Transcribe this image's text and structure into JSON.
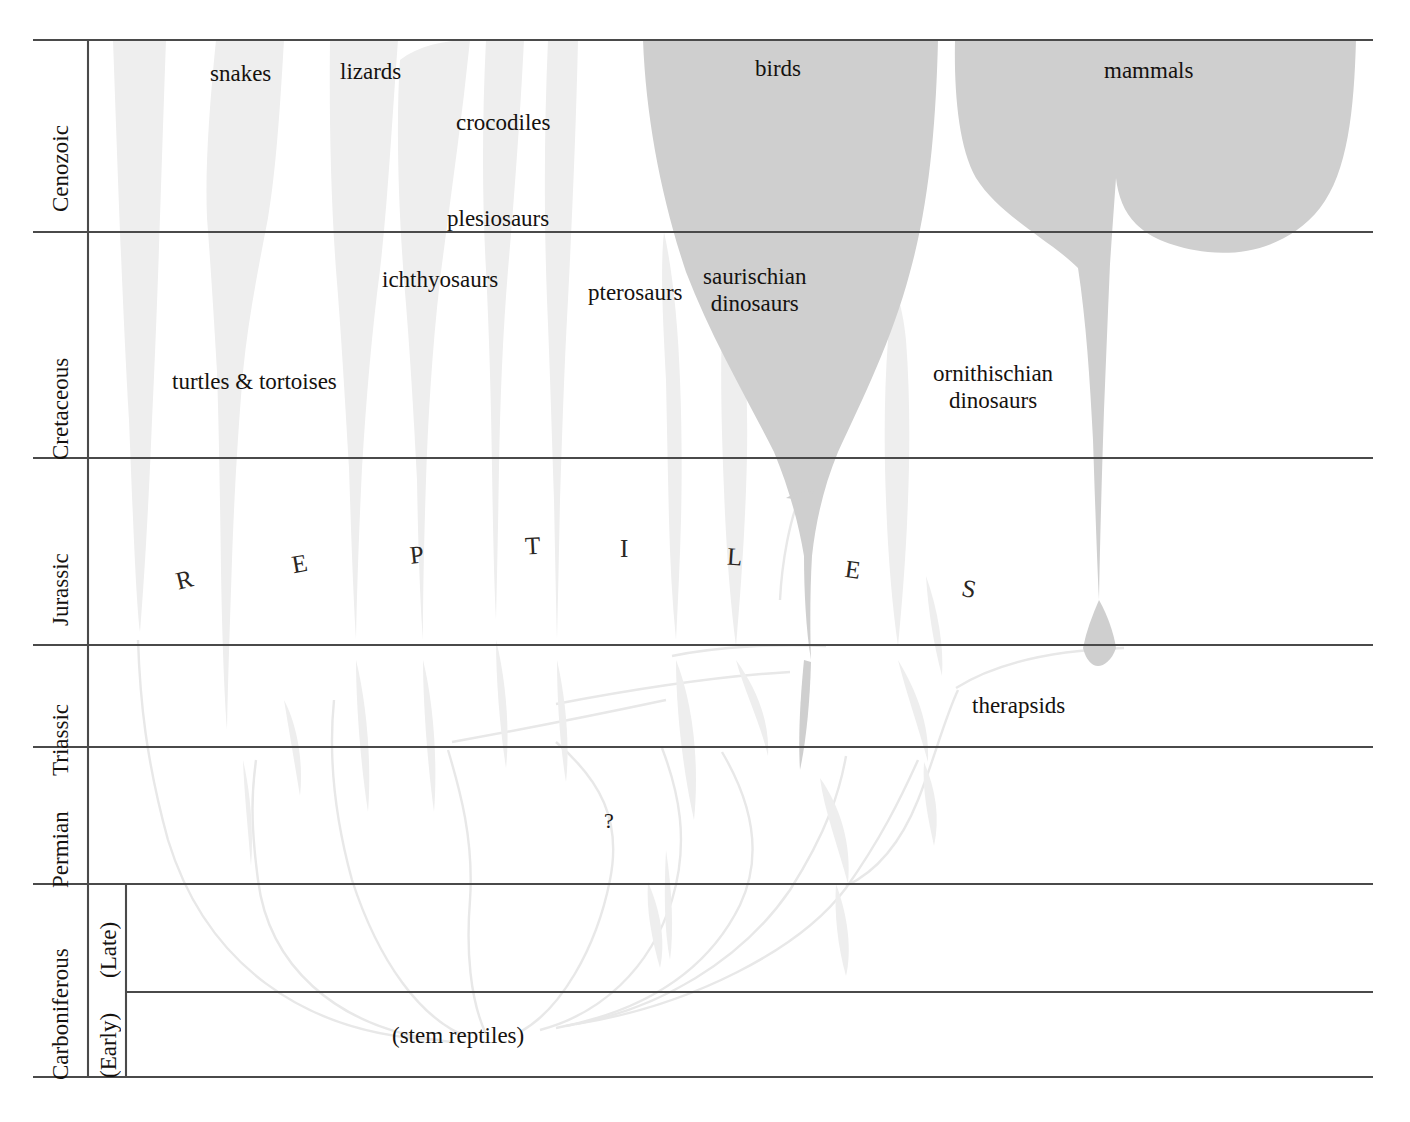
{
  "figure": {
    "kind": "phylogenetic-spindle-diagram",
    "background": "#ffffff",
    "line_color": "#4a4a4a",
    "pale_fill": "#eeeeee",
    "dark_fill": "#cfcfcf",
    "branch_color": "#e6e6e6"
  },
  "eras": [
    {
      "id": "cenozoic",
      "label": "Cenozoic",
      "y_top": 40,
      "y_bottom": 232
    },
    {
      "id": "cretaceous",
      "label": "Cretaceous",
      "y_top": 232,
      "y_bottom": 458
    },
    {
      "id": "jurassic",
      "label": "Jurassic",
      "y_top": 458,
      "y_bottom": 645
    },
    {
      "id": "triassic",
      "label": "Triassic",
      "y_top": 645,
      "y_bottom": 747
    },
    {
      "id": "permian",
      "label": "Permian",
      "y_top": 747,
      "y_bottom": 884
    },
    {
      "id": "carb-late",
      "label": "(Late)",
      "y_top": 884,
      "y_bottom": 992
    },
    {
      "id": "carb-early",
      "label": "(Early)",
      "y_top": 992,
      "y_bottom": 1077
    }
  ],
  "era_group": {
    "label": "Carboniferous",
    "spans": [
      "carb-late",
      "carb-early"
    ]
  },
  "boundary_lines_y": [
    40,
    232,
    458,
    645,
    747,
    884,
    992,
    1077
  ],
  "groups": [
    {
      "id": "turtles",
      "label": "turtles & tortoises",
      "x": 172,
      "y": 368,
      "shade": "pale"
    },
    {
      "id": "snakes",
      "label": "snakes",
      "x": 210,
      "y": 60,
      "shade": "pale"
    },
    {
      "id": "lizards",
      "label": "lizards",
      "x": 340,
      "y": 58,
      "shade": "pale"
    },
    {
      "id": "crocodiles",
      "label": "crocodiles",
      "x": 456,
      "y": 109,
      "shade": "pale"
    },
    {
      "id": "plesiosaurs",
      "label": "plesiosaurs",
      "x": 447,
      "y": 205,
      "shade": "pale"
    },
    {
      "id": "ichthyosaurs",
      "label": "ichthyosaurs",
      "x": 382,
      "y": 266,
      "shade": "pale"
    },
    {
      "id": "pterosaurs",
      "label": "pterosaurs",
      "x": 588,
      "y": 279,
      "shade": "pale"
    },
    {
      "id": "saurischian",
      "label": "saurischian\ndinosaurs",
      "x": 703,
      "y": 263,
      "shade": "pale"
    },
    {
      "id": "ornithischian",
      "label": "ornithischian\ndinosaurs",
      "x": 933,
      "y": 360,
      "shade": "pale"
    },
    {
      "id": "birds",
      "label": "birds",
      "x": 755,
      "y": 55,
      "shade": "dark"
    },
    {
      "id": "mammals",
      "label": "mammals",
      "x": 1104,
      "y": 57,
      "shade": "dark"
    },
    {
      "id": "therapsids",
      "label": "therapsids",
      "x": 972,
      "y": 692,
      "shade": "pale"
    }
  ],
  "watermark": {
    "text": "REPTILES",
    "letters": [
      {
        "ch": "R",
        "x": 176,
        "y": 566,
        "rot": -14
      },
      {
        "ch": "E",
        "x": 292,
        "y": 550,
        "rot": -10
      },
      {
        "ch": "P",
        "x": 410,
        "y": 541,
        "rot": -6
      },
      {
        "ch": "T",
        "x": 525,
        "y": 532,
        "rot": -3
      },
      {
        "ch": "I",
        "x": 620,
        "y": 535,
        "rot": 0
      },
      {
        "ch": "L",
        "x": 727,
        "y": 543,
        "rot": 4
      },
      {
        "ch": "E",
        "x": 845,
        "y": 556,
        "rot": 8
      },
      {
        "ch": "S",
        "x": 962,
        "y": 575,
        "rot": 12
      }
    ]
  },
  "annotations": [
    {
      "id": "stem-reptiles",
      "label": "(stem reptiles)",
      "x": 392,
      "y": 1022
    },
    {
      "id": "question-mark",
      "label": "?",
      "x": 604,
      "y": 808
    }
  ]
}
